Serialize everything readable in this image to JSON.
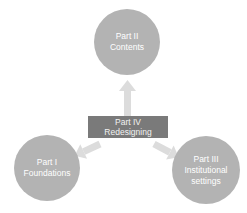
{
  "diagram": {
    "center": {
      "line1": "Part IV",
      "line2": "Redesigning",
      "color": "#7a7a7a"
    },
    "nodes": [
      {
        "id": "part-ii",
        "line1": "Part II",
        "line2": "Contents",
        "line3": ""
      },
      {
        "id": "part-i",
        "line1": "Part I",
        "line2": "Foundations",
        "line3": ""
      },
      {
        "id": "part-iii",
        "line1": "Part III",
        "line2": "Institutional",
        "line3": "settings"
      }
    ],
    "node_color": "#b3b3b3",
    "arrow_color": "#dcdcdc"
  }
}
